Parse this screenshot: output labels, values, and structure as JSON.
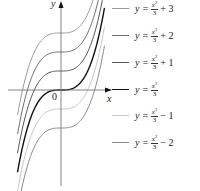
{
  "chart_data": {
    "type": "line",
    "title": "",
    "xlabel": "x",
    "ylabel": "y",
    "origin_label": "0",
    "grid": false,
    "legend_position": "right",
    "x_range": [
      -2.35,
      2.35
    ],
    "series": [
      {
        "name": "y = x^3/3 + 3",
        "offset": 3,
        "color": "#9a9a9a"
      },
      {
        "name": "y = x^3/3 + 2",
        "offset": 2,
        "color": "#6e6e6e"
      },
      {
        "name": "y = x^3/3 + 1",
        "offset": 1,
        "color": "#555555"
      },
      {
        "name": "y = x^3/3",
        "offset": 0,
        "color": "#111111"
      },
      {
        "name": "y = x^3/3 - 1",
        "offset": -1,
        "color": "#c8c8c8"
      },
      {
        "name": "y = x^3/3 - 2",
        "offset": -2,
        "color": "#8a8a8a"
      }
    ]
  },
  "legend": [
    {
      "lhs": "y =",
      "num": "x",
      "exp": "3",
      "den": "3",
      "rhs": "+ 3",
      "color": "#9a9a9a"
    },
    {
      "lhs": "y =",
      "num": "x",
      "exp": "3",
      "den": "3",
      "rhs": "+ 2",
      "color": "#6e6e6e"
    },
    {
      "lhs": "y =",
      "num": "x",
      "exp": "3",
      "den": "3",
      "rhs": "+ 1",
      "color": "#555555"
    },
    {
      "lhs": "y =",
      "num": "x",
      "exp": "3",
      "den": "3",
      "rhs": "",
      "color": "#111111"
    },
    {
      "lhs": "y =",
      "num": "x",
      "exp": "3",
      "den": "3",
      "rhs": "− 1",
      "color": "#c8c8c8"
    },
    {
      "lhs": "y =",
      "num": "x",
      "exp": "3",
      "den": "3",
      "rhs": "− 2",
      "color": "#8a8a8a"
    }
  ]
}
